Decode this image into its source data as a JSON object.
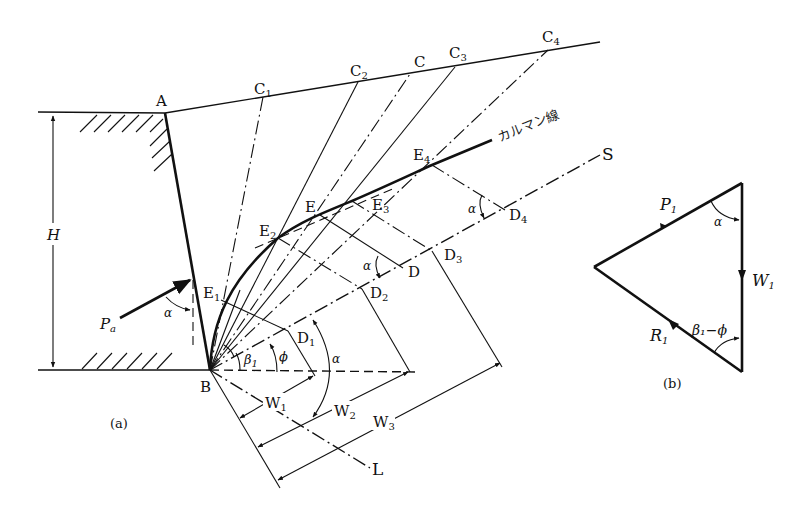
{
  "figure": {
    "panel_a_label": "(a)",
    "panel_b_label": "(b)"
  },
  "panel_a": {
    "points": {
      "A": "A",
      "B": "B",
      "C1": {
        "base": "C",
        "sub": "1"
      },
      "C2": {
        "base": "C",
        "sub": "2"
      },
      "C": "C",
      "C3": {
        "base": "C",
        "sub": "3"
      },
      "C4": {
        "base": "C",
        "sub": "4"
      },
      "E1": {
        "base": "E",
        "sub": "1"
      },
      "E2": {
        "base": "E",
        "sub": "2"
      },
      "E": "E",
      "E3": {
        "base": "E",
        "sub": "3"
      },
      "E4": {
        "base": "E",
        "sub": "4"
      },
      "D1": {
        "base": "D",
        "sub": "1"
      },
      "D2": {
        "base": "D",
        "sub": "2"
      },
      "D": "D",
      "D3": {
        "base": "D",
        "sub": "3"
      },
      "D4": {
        "base": "D",
        "sub": "4"
      },
      "S": "S",
      "L": "L"
    },
    "height_label": "H",
    "active_pressure": {
      "base": "P",
      "sub": "a"
    },
    "culmann_line_label": "カルマン線",
    "angles": {
      "alpha": "α",
      "phi": "ϕ",
      "beta1": {
        "base": "β",
        "sub": "1"
      }
    },
    "weights": {
      "W1": {
        "base": "W",
        "sub": "1"
      },
      "W2": {
        "base": "W",
        "sub": "2"
      },
      "W3": {
        "base": "W",
        "sub": "3"
      }
    }
  },
  "panel_b": {
    "P1": {
      "base": "P",
      "sub": "1"
    },
    "W1": {
      "base": "W",
      "sub": "1"
    },
    "R1": {
      "base": "R",
      "sub": "1"
    },
    "angle_top": "α",
    "angle_bottom": "β₁−ϕ"
  }
}
